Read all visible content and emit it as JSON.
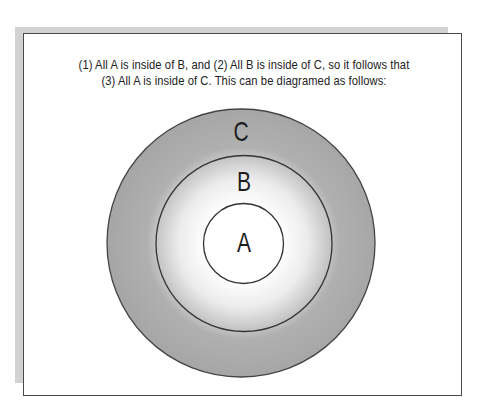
{
  "caption": {
    "line1": "(1) All A is inside of B, and   (2) All B is inside of C, so it follows that",
    "line2": "(3) All A is inside of C. This can be diagramed as follows:"
  },
  "diagram": {
    "type": "nested-circles (Euler diagram)",
    "circles": [
      {
        "label": "C",
        "cx": 241,
        "cy": 243,
        "r": 134,
        "role": "outermost set"
      },
      {
        "label": "B",
        "cx": 244,
        "cy": 243.5,
        "r": 88,
        "role": "middle set"
      },
      {
        "label": "A",
        "cx": 243.5,
        "cy": 243.5,
        "r": 40,
        "role": "innermost set"
      }
    ],
    "colors": {
      "outer_fill": "#a9a9a9",
      "center_fill": "#ffffff",
      "stroke": "#333333",
      "frame_border": "#4a4a4a",
      "frame_shadow": "#d2d2d2"
    }
  }
}
